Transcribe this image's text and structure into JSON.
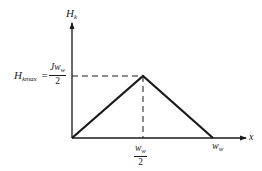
{
  "diagram": {
    "type": "triangular-distribution-plot",
    "y_axis": {
      "label": "H",
      "label_sub": "k"
    },
    "x_axis": {
      "label": "x"
    },
    "peak_label": {
      "lhs": "H",
      "lhs_sub": "kmax",
      "equals": "=",
      "numerator": "Jw",
      "numerator_sub": "w",
      "denominator": "2"
    },
    "x_ticks": [
      {
        "numerator": "w",
        "numerator_sub": "w",
        "denominator": "2"
      },
      {
        "label": "w",
        "label_sub": "w"
      }
    ],
    "points": [
      {
        "x": "0",
        "y": "0"
      },
      {
        "x": "w_w/2",
        "y": "H_kmax"
      },
      {
        "x": "w_w",
        "y": "0"
      }
    ],
    "colors": {
      "line": "#1a1a1a",
      "background": "#ffffff"
    }
  }
}
